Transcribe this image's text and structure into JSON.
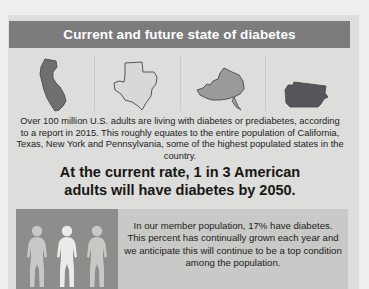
{
  "header": {
    "title": "Current and future state of diabetes"
  },
  "states": [
    {
      "name": "California",
      "icon": "california-state-shape",
      "fill": "#6f6f6d",
      "stroke": "#4a4a48"
    },
    {
      "name": "Texas",
      "icon": "texas-state-shape",
      "fill": "#d8d8d6",
      "stroke": "#555553"
    },
    {
      "name": "New York",
      "icon": "new-york-state-shape",
      "fill": "#9a9a98",
      "stroke": "#4a4a48"
    },
    {
      "name": "Pennsylvania",
      "icon": "pennsylvania-state-shape",
      "fill": "#56565a",
      "stroke": "#44444a"
    }
  ],
  "body": {
    "paragraph": "Over 100 million U.S. adults are living with diabetes or prediabetes, according to a report in 2015. This roughly equates to the entire population of California, Texas, New York and Pennsylvania, some of the highest populated states in the country."
  },
  "headline": {
    "line1": "At the current rate, 1 in 3 American",
    "line2": "adults will have diabetes by 2050."
  },
  "bottom": {
    "figures": [
      {
        "label": "person-figure-1",
        "fill": "#c8c8c4"
      },
      {
        "label": "person-figure-2",
        "fill": "#ebebe7"
      },
      {
        "label": "person-figure-3",
        "fill": "#c8c8c4"
      }
    ],
    "paragraph": "In our member population, 17% have diabetes. This percent has continually grown each year and we anticipate this will continue to be a top condition among the population."
  },
  "colors": {
    "header_bar": "#7c7c7c",
    "page_background": "#e9e9e7",
    "content_background": "#dddddb",
    "bottom_panel": "#c9c9c7",
    "figures_panel": "#8d8d8b"
  }
}
